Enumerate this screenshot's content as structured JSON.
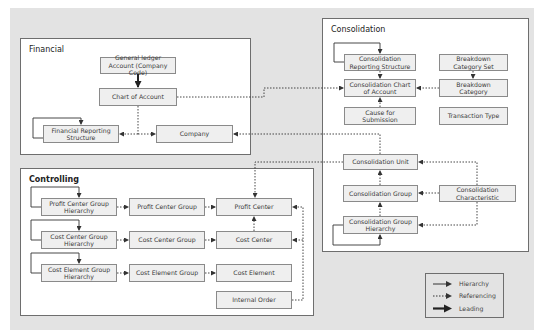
{
  "panels": {
    "financial": {
      "title": "Financial",
      "nodes": {
        "gl_account": "General ledger Account (Company Code)",
        "chart_of_account": "Chart of Account",
        "fin_reporting_structure": "Financial Reporting Structure",
        "company": "Company"
      }
    },
    "consolidation": {
      "title": "Consolidation",
      "nodes": {
        "cons_reporting_structure": "Consolidation Reporting Structure",
        "breakdown_category_set": "Breakdown Category Set",
        "cons_chart_of_account": "Consolidation Chart of Account",
        "breakdown_category": "Breakdown Category",
        "cause_for_submission": "Cause for Submission",
        "transaction_type": "Transaction Type",
        "cons_unit": "Consolidation Unit",
        "cons_group": "Consolidation Group",
        "cons_characteristic": "Consolidation Characteristic",
        "cons_group_hierarchy": "Consolidation Group Hierarchy"
      }
    },
    "controlling": {
      "title": "Controlling",
      "nodes": {
        "pc_group_hierarchy": "Profit Center Group Hierarchy",
        "pc_group": "Profit Center Group",
        "profit_center": "Profit Center",
        "cc_group_hierarchy": "Cost Center Group Hierarchy",
        "cc_group": "Cost Center Group",
        "cost_center": "Cost Center",
        "ce_group_hierarchy": "Cost Element Group Hierarchy",
        "ce_group": "Cost Element Group",
        "cost_element": "Cost Element",
        "internal_order": "Internal Order"
      }
    }
  },
  "legend": {
    "items": [
      {
        "label": "Hierarchy",
        "style": "solid-thin"
      },
      {
        "label": "Referencing",
        "style": "dotted"
      },
      {
        "label": "Leading",
        "style": "solid-thick"
      }
    ]
  },
  "colors": {
    "background": "#e3e3e3",
    "panel": "#ffffff",
    "node_fill": "#efefef",
    "node_border": "#8a8a8a",
    "line": "#333333"
  }
}
